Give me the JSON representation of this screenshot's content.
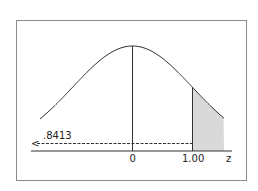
{
  "diagram": {
    "type": "standard-normal-curve",
    "axis_label": "z",
    "ticks": [
      {
        "label": "0",
        "z": 0
      },
      {
        "label": "1.00",
        "z": 1.0
      }
    ],
    "shaded_region": {
      "from_z": 1.0,
      "to": "right-tail",
      "fill": "#d9d9d9"
    },
    "arrow": {
      "label": ".8413",
      "direction": "left",
      "glyph": "<",
      "style": "dashed"
    },
    "colors": {
      "line": "#333333",
      "frame": "#8a8a8a",
      "shade": "#d9d9d9",
      "background": "#ffffff"
    }
  }
}
